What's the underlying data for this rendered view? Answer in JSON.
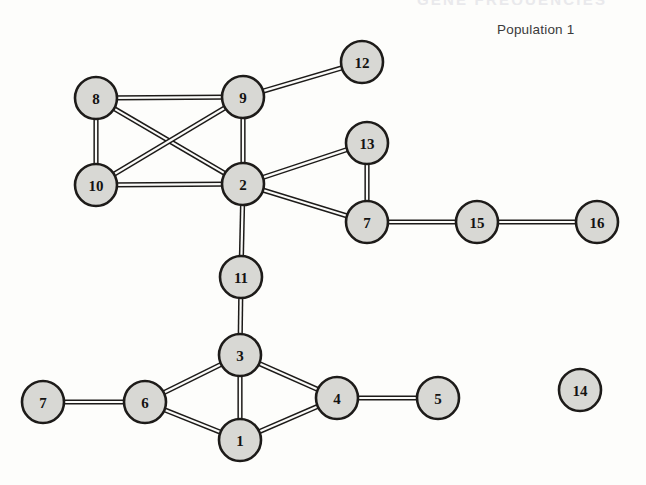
{
  "figure": {
    "clipped_header_text": "GENE FREQUENCIES",
    "population_label": "Population 1",
    "background_color": "#fdfdfb",
    "node_fill_color": "#d8d8d4",
    "node_stroke_color": "#1d1b19",
    "edge_color": "#1d1b19",
    "node_radius": 21
  },
  "chart_data": {
    "type": "diagram",
    "subtype": "node-link-graph",
    "title": "Population 1",
    "layout_hint": "undirected graph, stippled circular nodes with double-line edges, isolated node at right",
    "nodes": [
      {
        "id": "n8",
        "label": "8",
        "x": 96,
        "y": 98
      },
      {
        "id": "n9",
        "label": "9",
        "x": 243,
        "y": 97
      },
      {
        "id": "n12",
        "label": "12",
        "x": 362,
        "y": 62
      },
      {
        "id": "n10",
        "label": "10",
        "x": 96,
        "y": 185
      },
      {
        "id": "n2",
        "label": "2",
        "x": 243,
        "y": 184
      },
      {
        "id": "n13",
        "label": "13",
        "x": 367,
        "y": 143
      },
      {
        "id": "n7t",
        "label": "7",
        "x": 367,
        "y": 222
      },
      {
        "id": "n15",
        "label": "15",
        "x": 477,
        "y": 222
      },
      {
        "id": "n16",
        "label": "16",
        "x": 597,
        "y": 222
      },
      {
        "id": "n11",
        "label": "11",
        "x": 241,
        "y": 277
      },
      {
        "id": "n3",
        "label": "3",
        "x": 240,
        "y": 355
      },
      {
        "id": "n14",
        "label": "14",
        "x": 580,
        "y": 390
      },
      {
        "id": "n7b",
        "label": "7",
        "x": 43,
        "y": 402
      },
      {
        "id": "n6",
        "label": "6",
        "x": 145,
        "y": 402
      },
      {
        "id": "n4",
        "label": "4",
        "x": 337,
        "y": 398
      },
      {
        "id": "n5",
        "label": "5",
        "x": 438,
        "y": 398
      },
      {
        "id": "n1",
        "label": "1",
        "x": 240,
        "y": 440
      }
    ],
    "edges": [
      {
        "source": "n8",
        "target": "n9"
      },
      {
        "source": "n8",
        "target": "n10"
      },
      {
        "source": "n8",
        "target": "n2"
      },
      {
        "source": "n9",
        "target": "n10"
      },
      {
        "source": "n9",
        "target": "n2"
      },
      {
        "source": "n9",
        "target": "n12"
      },
      {
        "source": "n10",
        "target": "n2"
      },
      {
        "source": "n2",
        "target": "n13"
      },
      {
        "source": "n2",
        "target": "n7t"
      },
      {
        "source": "n2",
        "target": "n11"
      },
      {
        "source": "n13",
        "target": "n7t"
      },
      {
        "source": "n7t",
        "target": "n15"
      },
      {
        "source": "n15",
        "target": "n16"
      },
      {
        "source": "n11",
        "target": "n3"
      },
      {
        "source": "n3",
        "target": "n6"
      },
      {
        "source": "n3",
        "target": "n1"
      },
      {
        "source": "n3",
        "target": "n4"
      },
      {
        "source": "n6",
        "target": "n7b"
      },
      {
        "source": "n6",
        "target": "n1"
      },
      {
        "source": "n1",
        "target": "n4"
      },
      {
        "source": "n4",
        "target": "n5"
      }
    ],
    "isolated_nodes": [
      "n14"
    ],
    "node_count": 17,
    "edge_count": 21
  }
}
